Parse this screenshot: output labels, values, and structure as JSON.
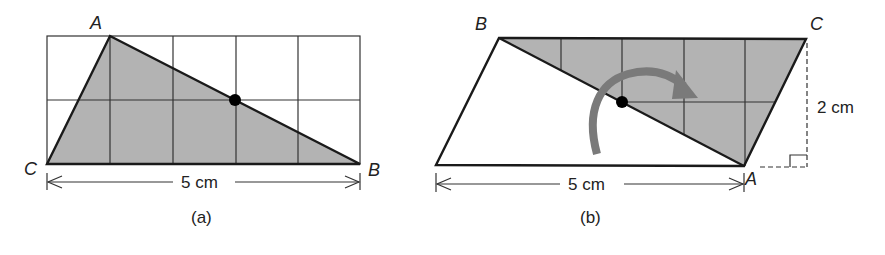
{
  "figure_a": {
    "caption": "(a)",
    "vertices": {
      "A": "A",
      "B": "B",
      "C": "C"
    },
    "width_label": "5 cm",
    "grid": {
      "columns": 5,
      "rows": 2
    }
  },
  "figure_b": {
    "caption": "(b)",
    "vertices": {
      "A": "A",
      "B": "B",
      "C": "C"
    },
    "width_label": "5 cm",
    "height_label": "2 cm",
    "rotation": "rotation-arrow"
  },
  "colors": {
    "shade": "#b3b3b3",
    "line": "#1a1a1a",
    "arrow": "#7a7a7a"
  }
}
